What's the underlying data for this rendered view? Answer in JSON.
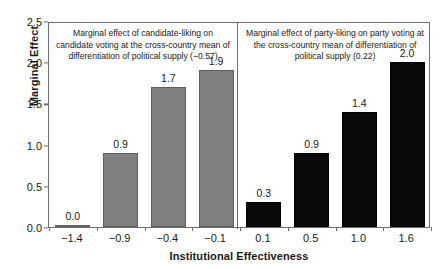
{
  "chart_data": {
    "type": "bar",
    "title": "",
    "xlabel": "Institutional Effectiveness",
    "ylabel": "Marginal Effect",
    "ylim": [
      0.0,
      2.5
    ],
    "yticks": [
      "0.0",
      "0.5",
      "1.0",
      "1.5",
      "2.0",
      "2.5"
    ],
    "ytick_values": [
      0.0,
      0.5,
      1.0,
      1.5,
      2.0,
      2.5
    ],
    "grid": false,
    "legend": "none",
    "panels": [
      {
        "name": "candidate-liking",
        "annotation": "Marginal effect of candidate-liking on candidate voting at the cross-country mean of differentiation of political supply (−0.57)",
        "color": "#808080",
        "categories": [
          "−1.4",
          "−0.9",
          "−0.4",
          "−0.1"
        ],
        "values": [
          0.0,
          0.9,
          1.7,
          1.9
        ],
        "value_labels": [
          "0.0",
          "0.9",
          "1.7",
          "1.9"
        ]
      },
      {
        "name": "party-liking",
        "annotation": "Marginal effect of party-liking on party voting at the cross-country mean of differentiation of political supply  (0.22)",
        "color": "#0a0a0a",
        "categories": [
          "0.1",
          "0.5",
          "1.0",
          "1.6"
        ],
        "values": [
          0.3,
          0.9,
          1.4,
          2.0
        ],
        "value_labels": [
          "0.3",
          "0.9",
          "1.4",
          "2.0"
        ]
      }
    ],
    "categories_all": [
      "−1.4",
      "−0.9",
      "−0.4",
      "−0.1",
      "0.1",
      "0.5",
      "1.0",
      "1.6"
    ],
    "values_all": [
      0.0,
      0.9,
      1.7,
      1.9,
      0.3,
      0.9,
      1.4,
      2.0
    ]
  }
}
